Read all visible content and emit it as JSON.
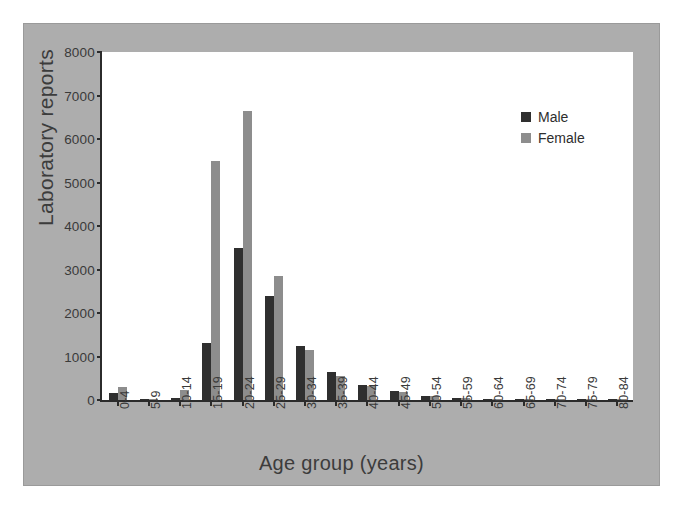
{
  "chart_data": {
    "type": "bar",
    "title": "",
    "xlabel": "Age group (years)",
    "ylabel": "Laboratory reports",
    "ylim": [
      0,
      8000
    ],
    "yticks": [
      0,
      1000,
      2000,
      3000,
      4000,
      5000,
      6000,
      7000,
      8000
    ],
    "grid": false,
    "legend_position": "top-right",
    "categories": [
      "0-4",
      "5-9",
      "10-14",
      "15-19",
      "20-24",
      "25-29",
      "30-34",
      "35-39",
      "40-44",
      "45-49",
      "50-54",
      "55-59",
      "60-64",
      "65-69",
      "70-74",
      "75-79",
      "80-84"
    ],
    "series": [
      {
        "name": "Male",
        "color": "#2f2f2f",
        "values": [
          150,
          20,
          40,
          1320,
          3500,
          2400,
          1250,
          650,
          350,
          200,
          95,
          40,
          20,
          15,
          10,
          5,
          5
        ]
      },
      {
        "name": "Female",
        "color": "#8d8d8d",
        "values": [
          300,
          25,
          230,
          5500,
          6650,
          2850,
          1150,
          550,
          330,
          180,
          90,
          35,
          18,
          12,
          25,
          5,
          5
        ]
      }
    ]
  },
  "figure": {
    "background_color": "#adadad",
    "plot_background_color": "#ffffff",
    "axis_color": "#2b2b2b"
  }
}
